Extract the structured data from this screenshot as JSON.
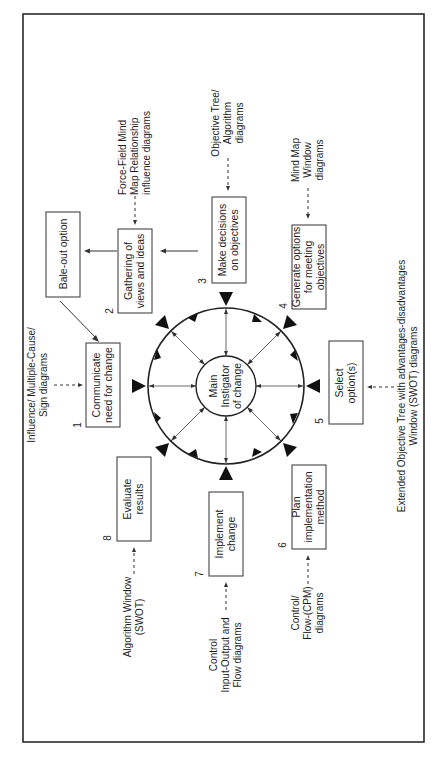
{
  "diagram": {
    "orientation": "rotated-90-ccw",
    "center": {
      "label_lines": [
        "Main",
        "Instigator",
        "of change"
      ]
    },
    "steps": [
      {
        "number": "1",
        "label_lines": [
          "Communicate",
          "need for change"
        ],
        "tool_lines": [
          "Influence/ Multiple-Cause/",
          "Sign diagrams"
        ]
      },
      {
        "number": "2",
        "label_lines": [
          "Gathering of",
          "views and ideas"
        ],
        "tool_lines": [
          "Force-Field Mind",
          "Map Relationship",
          "influence diagrams"
        ]
      },
      {
        "number": "3",
        "label_lines": [
          "Make decisions",
          "on objectives"
        ],
        "tool_lines": [
          "Objective Tree/",
          "Algorithm",
          "diagrams"
        ]
      },
      {
        "number": "4",
        "label_lines": [
          "Generate options",
          "for meeting",
          "objectives"
        ],
        "tool_lines": [
          "Mind Map",
          "Window",
          "diagrams"
        ]
      },
      {
        "number": "5",
        "label_lines": [
          "Select",
          "option(s)"
        ],
        "tool_lines": [
          "Extended Objective Tree with advantages-disadvantages",
          "Window (SWOT) diagrams"
        ]
      },
      {
        "number": "6",
        "label_lines": [
          "Plan",
          "implementation",
          "method"
        ],
        "tool_lines": [
          "Control/",
          "Flow-(CPM)",
          "diagrams"
        ]
      },
      {
        "number": "7",
        "label_lines": [
          "Implement",
          "change"
        ],
        "tool_lines": [
          "Control",
          "Input-Output and",
          "Flow diagrams"
        ]
      },
      {
        "number": "8",
        "label_lines": [
          "Evaluate",
          "results"
        ],
        "tool_lines": [
          "Algorithm Window",
          "(SWOT)"
        ]
      }
    ],
    "bale_out": {
      "label": "Bale-out option"
    },
    "colors": {
      "line": "#222222",
      "arrowhead": "#111111",
      "background": "#ffffff"
    }
  }
}
